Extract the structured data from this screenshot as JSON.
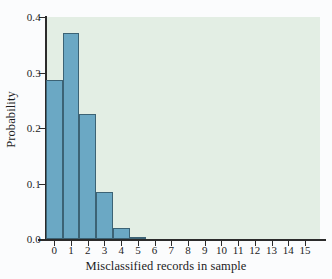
{
  "chart_data": {
    "type": "bar",
    "title": "",
    "subtitle": "",
    "xlabel": "Misclassified records in sample",
    "ylabel": "Probability",
    "categories": [
      "0",
      "1",
      "2",
      "3",
      "4",
      "5",
      "6",
      "7",
      "8",
      "9",
      "10",
      "11",
      "12",
      "13",
      "14",
      "15"
    ],
    "values": [
      0.286,
      0.372,
      0.226,
      0.085,
      0.02,
      0.003,
      0.0,
      0.0,
      0.0,
      0.0,
      0.0,
      0.0,
      0.0,
      0.0,
      0.0,
      0.0
    ],
    "x": [
      0,
      1,
      2,
      3,
      4,
      5,
      6,
      7,
      8,
      9,
      10,
      11,
      12,
      13,
      14,
      15
    ],
    "xlim": [
      -0.5,
      15.9
    ],
    "ylim": [
      0.0,
      0.4
    ],
    "y_ticks": [
      0.0,
      0.1,
      0.2,
      0.3,
      0.4
    ],
    "y_tick_labels": [
      "0.0",
      "0.1",
      "0.2",
      "0.3",
      "0.4"
    ],
    "x_ticks": [
      0,
      1,
      2,
      3,
      4,
      5,
      6,
      7,
      8,
      9,
      10,
      11,
      12,
      13,
      14,
      15
    ],
    "x_tick_labels": [
      "0",
      "1",
      "2",
      "3",
      "4",
      "5",
      "6",
      "7",
      "8",
      "9",
      "10",
      "11",
      "12",
      "13",
      "14",
      "15"
    ],
    "grid": false,
    "legend": null,
    "legend_position": "none",
    "bar_width": 1.0,
    "colors": {
      "bar_fill": "#6ba8c4",
      "bar_edge": "#3c6375",
      "plot_background": "#e3eee4",
      "figure_background": "#fbfcfd",
      "axis": "#2b2b2b",
      "text": "#1d1d1d"
    }
  }
}
